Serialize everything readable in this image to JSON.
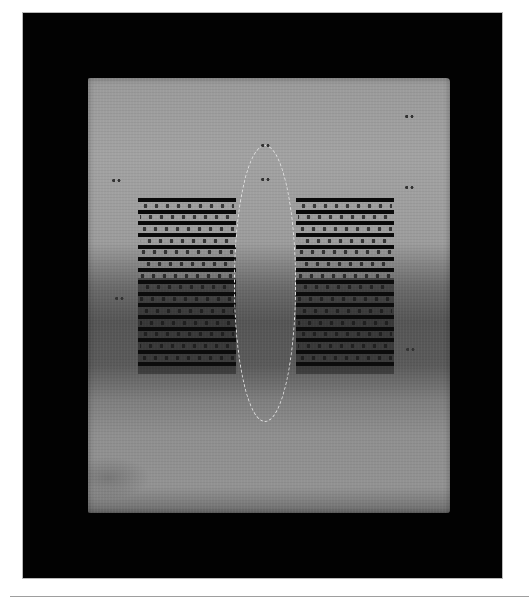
{
  "image": {
    "description": "Photograph of a rectangular textile artwork on a black background: a light gray fabric panel with two blocks of horizontal black stripes flanking a central vertical lens/ellipse outlined in white stitching; the lower-middle band of fabric is darkened.",
    "colors": {
      "page_background": "#ffffff",
      "frame": "#020202",
      "fabric_light": "#a0a0a0",
      "fabric_dark": "#555555",
      "stripes": "#0a0a0a",
      "stitching": "#e6e6e6",
      "rule": "#9e9e9e"
    },
    "frame": {
      "x": 23,
      "y": 13,
      "width": 479,
      "height": 565
    },
    "fabric": {
      "x": 88,
      "y": 78,
      "width": 362,
      "height": 435
    },
    "stripe_blocks": [
      {
        "side": "left",
        "x": 138,
        "y": 198,
        "width": 98,
        "stripe_count": 15
      },
      {
        "side": "right",
        "x": 296,
        "y": 198,
        "width": 98,
        "stripe_count": 15
      }
    ],
    "lens": {
      "cx": 265,
      "top": 145,
      "bottom": 422,
      "width": 62
    },
    "marks": [
      {
        "x": 110,
        "y": 178
      },
      {
        "x": 403,
        "y": 114
      },
      {
        "x": 403,
        "y": 185
      },
      {
        "x": 259,
        "y": 143
      },
      {
        "x": 259,
        "y": 177
      },
      {
        "x": 113,
        "y": 296
      },
      {
        "x": 404,
        "y": 347
      }
    ]
  }
}
